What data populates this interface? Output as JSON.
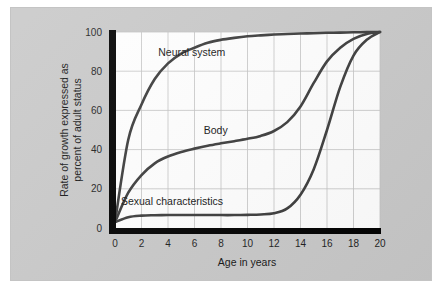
{
  "figure": {
    "background_color": "#c9c9c9",
    "plot_background_color": "#ffffff",
    "curve_color": "#3c3c3c",
    "grid_color": "#c3c3c3",
    "axis_color": "#000000"
  },
  "axes": {
    "x_title": "Age in years",
    "y_title_line1": "Rate of growth expressed as",
    "y_title_line2": "percent of adult status",
    "x_ticks": [
      "0",
      "2",
      "4",
      "6",
      "8",
      "10",
      "12",
      "14",
      "16",
      "18",
      "20"
    ],
    "y_ticks": [
      "0",
      "20",
      "40",
      "60",
      "80",
      "100"
    ]
  },
  "labels": {
    "neural": "Neural system",
    "body": "Body",
    "sexual": "Sexual characteristics"
  },
  "chart_data": {
    "type": "line",
    "title": "",
    "xlabel": "Age in years",
    "ylabel": "Rate of growth expressed as percent of adult status",
    "xlim": [
      0,
      20
    ],
    "ylim": [
      0,
      100
    ],
    "xticks": [
      0,
      2,
      4,
      6,
      8,
      10,
      12,
      14,
      16,
      18,
      20
    ],
    "yticks": [
      0,
      20,
      40,
      60,
      80,
      100
    ],
    "grid": true,
    "legend": "inline-annotations",
    "x": [
      0,
      1,
      2,
      3,
      4,
      5,
      6,
      7,
      8,
      9,
      10,
      11,
      12,
      13,
      14,
      15,
      16,
      17,
      18,
      19,
      20
    ],
    "series": [
      {
        "name": "Neural system",
        "label_x": 5.8,
        "label_y": 88,
        "values": [
          3,
          45,
          63,
          76,
          84,
          89,
          92,
          94.5,
          96,
          97,
          97.8,
          98.3,
          98.7,
          99,
          99.2,
          99.4,
          99.6,
          99.7,
          99.85,
          99.95,
          100
        ]
      },
      {
        "name": "Body",
        "label_x": 7.6,
        "label_y": 48,
        "values": [
          3,
          18,
          27,
          33,
          36.5,
          38.8,
          40.5,
          42,
          43.2,
          44.3,
          45.5,
          47,
          49.5,
          54,
          62,
          74,
          85,
          92,
          96.5,
          99,
          100
        ]
      },
      {
        "name": "Sexual characteristics",
        "label_x": 4.3,
        "label_y": 12,
        "values": [
          3,
          5.5,
          6.3,
          6.5,
          6.6,
          6.6,
          6.6,
          6.6,
          6.6,
          6.6,
          6.7,
          6.9,
          7.5,
          10,
          17,
          30,
          50,
          72,
          88,
          96,
          100
        ]
      }
    ]
  }
}
